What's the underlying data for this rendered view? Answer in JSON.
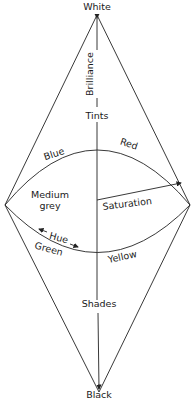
{
  "diagram": {
    "type": "colour-solid double cone",
    "labels": {
      "top": "White",
      "bottom": "Black",
      "axis_upper": "Brilliance",
      "tints": "Tints",
      "shades": "Shades",
      "center_line1": "Medium",
      "center_line2": "grey",
      "saturation": "Saturation",
      "hue": "Hue",
      "blue": "Blue",
      "red": "Red",
      "green": "Green",
      "yellow": "Yellow"
    },
    "colors": {
      "ink": "#222222",
      "background": "#ffffff"
    }
  }
}
